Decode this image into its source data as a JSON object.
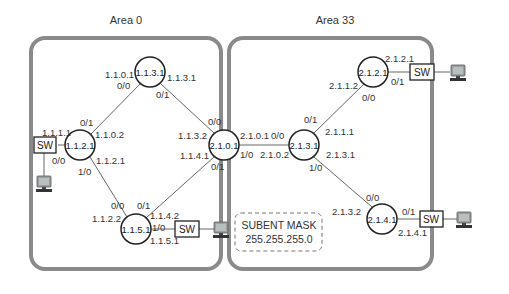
{
  "diagram": {
    "areas": [
      {
        "name": "Area 0"
      },
      {
        "name": "Area 33"
      }
    ],
    "routers": [
      {
        "id": "1.1.3.1"
      },
      {
        "id": "1.1.2.1"
      },
      {
        "id": "2.1.0.1"
      },
      {
        "id": "1.1.5.1"
      },
      {
        "id": "2.1.3.1"
      },
      {
        "id": "2.1.2.1"
      },
      {
        "id": "2.1.4.1"
      }
    ],
    "switches": [
      {
        "label": "SW"
      },
      {
        "label": "SW"
      },
      {
        "label": "SW"
      },
      {
        "label": "SW"
      }
    ],
    "labels": {
      "r1131_left_ip": "1.1.0.1",
      "r1131_left_if": "0/0",
      "r1131_right_ip": "1.1.3.1",
      "r1131_right_if": "0/1",
      "r1121_top_if": "0/1",
      "r1121_top_ip": "1.1.0.2",
      "r1121_sw_ip": "1.1.1.1",
      "r1121_sw_if": "0/0",
      "r1121_bot_ip": "1.1.2.1",
      "r1121_bot_if": "1/0",
      "r2101_top_if": "0/0",
      "r2101_top_ip": "1.1.3.2",
      "r2101_bot_ip": "1.1.4.1",
      "r2101_bot_if": "0/1",
      "r2101_right_ip": "2.1.0.1",
      "r2101_right_if": "1/0",
      "r1151_top_if0": "0/0",
      "r1151_top_if1": "0/1",
      "r1151_left_ip": "1.1.2.2",
      "r1151_right_ip": "1.1.4.2",
      "r1151_sw_if": "1/0",
      "r1151_sw_ip": "1.1.5.1",
      "r2131_left_if": "0/0",
      "r2131_left_ip": "2.1.0.2",
      "r2131_top_if": "0/1",
      "r2131_top_ip": "2.1.1.1",
      "r2131_bot_ip": "2.1.3.1",
      "r2131_bot_if": "1/0",
      "r2121_left_ip": "2.1.1.2",
      "r2121_left_if": "0/0",
      "r2121_sw_ip": "2.1.2.1",
      "r2121_sw_if": "0/1",
      "r2141_top_if": "0/0",
      "r2141_left_ip": "2.1.3.2",
      "r2141_sw_if": "0/1",
      "r2141_sw_ip": "2.1.4.1"
    },
    "subnet_note": {
      "line1": "SUBENT MASK",
      "line2": "255.255.255.0"
    },
    "colors": {
      "area_border": "#8a8a8a",
      "router_stroke": "#222222",
      "link": "#555555",
      "note_border": "#777777"
    }
  }
}
